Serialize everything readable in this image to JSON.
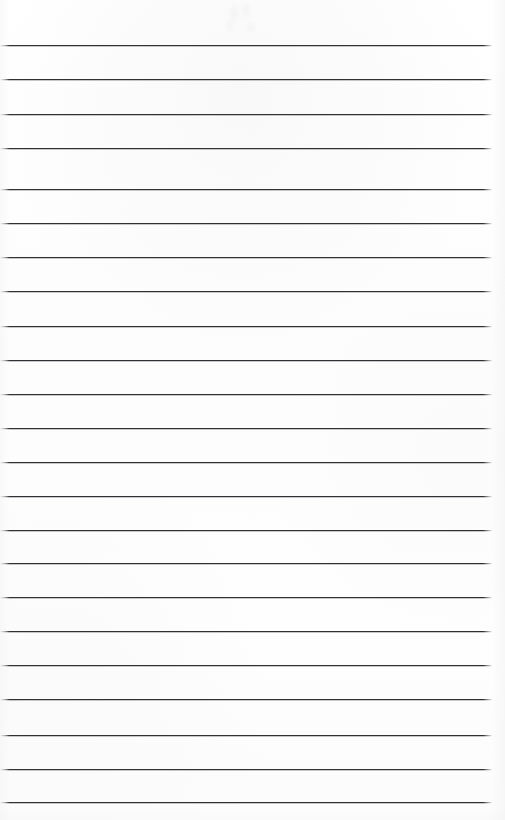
{
  "document": {
    "kind": "scanned-ruled-notebook-page",
    "title": "Blank ruled notebook page",
    "orientation": "portrait",
    "page_width": 505,
    "page_height": 820,
    "background_color": "#fefefe",
    "has_written_content": false,
    "written_lines": []
  },
  "ruling": {
    "line_color": "#2f3134",
    "line_thickness_px": 1,
    "line_count": 23,
    "first_line_y": 45,
    "line_spacing_px": 34.4,
    "line_start_x": 0,
    "line_end_x": 492,
    "margin_rule": "none",
    "lines": [
      {
        "index": 1,
        "y": 45,
        "x_start": 0,
        "x_end": 492
      },
      {
        "index": 2,
        "y": 79,
        "x_start": 0,
        "x_end": 492
      },
      {
        "index": 3,
        "y": 114,
        "x_start": 0,
        "x_end": 492
      },
      {
        "index": 4,
        "y": 148,
        "x_start": 0,
        "x_end": 492
      },
      {
        "index": 5,
        "y": 189,
        "x_start": 0,
        "x_end": 492
      },
      {
        "index": 6,
        "y": 223,
        "x_start": 0,
        "x_end": 492
      },
      {
        "index": 7,
        "y": 257,
        "x_start": 0,
        "x_end": 492
      },
      {
        "index": 8,
        "y": 291,
        "x_start": 0,
        "x_end": 492
      },
      {
        "index": 9,
        "y": 326,
        "x_start": 0,
        "x_end": 492
      },
      {
        "index": 10,
        "y": 360,
        "x_start": 0,
        "x_end": 492
      },
      {
        "index": 11,
        "y": 394,
        "x_start": 0,
        "x_end": 492
      },
      {
        "index": 12,
        "y": 428,
        "x_start": 0,
        "x_end": 492
      },
      {
        "index": 13,
        "y": 462,
        "x_start": 0,
        "x_end": 492
      },
      {
        "index": 14,
        "y": 496,
        "x_start": 0,
        "x_end": 492
      },
      {
        "index": 15,
        "y": 530,
        "x_start": 0,
        "x_end": 492
      },
      {
        "index": 16,
        "y": 563,
        "x_start": 0,
        "x_end": 492
      },
      {
        "index": 17,
        "y": 597,
        "x_start": 0,
        "x_end": 492
      },
      {
        "index": 18,
        "y": 631,
        "x_start": 0,
        "x_end": 492
      },
      {
        "index": 19,
        "y": 665,
        "x_start": 0,
        "x_end": 492
      },
      {
        "index": 20,
        "y": 699,
        "x_start": 0,
        "x_end": 492
      },
      {
        "index": 21,
        "y": 735,
        "x_start": 0,
        "x_end": 492
      },
      {
        "index": 22,
        "y": 769,
        "x_start": 0,
        "x_end": 492
      },
      {
        "index": 23,
        "y": 802,
        "x_start": 0,
        "x_end": 492
      }
    ]
  },
  "artifacts": {
    "top_center_smudge": {
      "name": "faint-grey-smudge",
      "x": 216,
      "y": 0,
      "width": 58,
      "height": 34,
      "color": "#ededef",
      "description": "very faint light-grey scanning artifact near top centre"
    }
  }
}
